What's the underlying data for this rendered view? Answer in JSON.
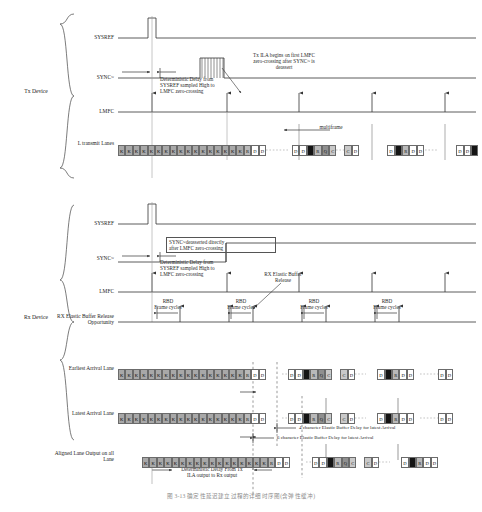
{
  "figure": {
    "caption": "图 3-13   确定性延迟建立过程的详细时序图(含弹性缓冲)",
    "width": 482,
    "height": 512
  },
  "devices": [
    {
      "id": "tx",
      "label": "Tx\nDevice"
    },
    {
      "id": "rx",
      "label": "Rx\nDevice"
    }
  ],
  "tx": {
    "signals": [
      {
        "name": "sysref",
        "label": "SYSREF"
      },
      {
        "name": "sync",
        "label": "SYNC~"
      },
      {
        "name": "lmfc",
        "label": "LMFC"
      },
      {
        "name": "lanes",
        "label": "L transmit\nLanes"
      }
    ],
    "annotations": [
      {
        "name": "tx-ila-note",
        "text": "Tx ILA begins on first LMFC\nzero-crossing after SYNC~ is\ndeassert"
      },
      {
        "name": "tx-det-delay-note",
        "text": "Deterministic Delay from\nSYSREF sampled High to\nLMFC zero-crossing"
      },
      {
        "name": "multiframe-label",
        "text": "multiframe"
      }
    ],
    "lane_groups": [
      {
        "name": "tx-k-run",
        "chars": [
          "K",
          "K",
          "K",
          "K",
          "K",
          "K",
          "K",
          "K",
          "K",
          "K",
          "K",
          "K",
          "K",
          "K",
          "K",
          "K",
          "K",
          "R",
          "D",
          "D"
        ]
      },
      {
        "name": "tx-seg-2",
        "chars": [
          "D",
          "D",
          "BK",
          "R",
          "Q",
          "C"
        ]
      },
      {
        "name": "tx-seg-3",
        "chars": [
          "C",
          "D"
        ]
      },
      {
        "name": "tx-seg-4",
        "chars": [
          "D",
          "BK",
          "R",
          "D",
          "D"
        ]
      },
      {
        "name": "tx-seg-5",
        "chars": [
          "D",
          "D",
          "BK"
        ]
      }
    ]
  },
  "rx": {
    "signals": [
      {
        "name": "sysref",
        "label": "SYSREF"
      },
      {
        "name": "sync",
        "label": "SYNC~"
      },
      {
        "name": "lmfc",
        "label": "LMFC"
      },
      {
        "name": "ebuf",
        "label": "RX Elastic Buffer\nRelease Opportunity"
      }
    ],
    "annotations": [
      {
        "name": "rx-sync-note",
        "text": "SYNC~deasserted directly\nafter LMFC zero-crossing"
      },
      {
        "name": "rx-det-delay-note",
        "text": "Deterministic Delay from\nSYSREF sampled High to\nLMFC zero-crossing"
      },
      {
        "name": "rx-release-note",
        "text": "RX Elastic Buffer\nRelease"
      }
    ],
    "rbd_labels": [
      {
        "name": "rbd-1",
        "text": "RBD\nFrame cycles"
      },
      {
        "name": "rbd-2",
        "text": "RBD\nFrame cycles"
      },
      {
        "name": "rbd-3",
        "text": "RBD\nFrame cycles"
      },
      {
        "name": "rbd-4",
        "text": "RBD\nFrame cycles"
      }
    ],
    "lanes": [
      {
        "name": "earliest-arrival-lane",
        "label": "Earliest Arrival\nLane"
      },
      {
        "name": "latest-arrival-lane",
        "label": "Latest Arrival\nLane"
      },
      {
        "name": "aligned-lane-output",
        "label": "Aligned Lane\nOutput on all\nLane"
      }
    ],
    "delay_notes": [
      {
        "name": "delay-4char",
        "text": "4 character Elastic Buffer Delay  for latest Arrival"
      },
      {
        "name": "delay-6char",
        "text": "6 character Elastic Buffer Delay  for latest Arrival"
      },
      {
        "name": "delay-tx-rx",
        "text": "Deterministic Delay From Tx\nILA output to Rx output"
      }
    ],
    "earliest_groups": [
      {
        "name": "e-k-run",
        "chars": [
          "K",
          "K",
          "K",
          "K",
          "K",
          "K",
          "K",
          "K",
          "K",
          "K",
          "K",
          "K",
          "K",
          "K",
          "K",
          "K",
          "K",
          "R",
          "D",
          "D"
        ]
      },
      {
        "name": "e-seg-2",
        "chars": [
          "D",
          "D",
          "BK",
          "R",
          "Q",
          "C"
        ]
      },
      {
        "name": "e-seg-3",
        "chars": [
          "C",
          "D"
        ]
      },
      {
        "name": "e-seg-4",
        "chars": [
          "D",
          "BK",
          "R",
          "D",
          "D"
        ]
      },
      {
        "name": "e-seg-5",
        "chars": [
          "D",
          "D"
        ]
      }
    ],
    "latest_groups": [
      {
        "name": "l-k-run",
        "chars": [
          "K",
          "K",
          "K",
          "K",
          "K",
          "K",
          "K",
          "K",
          "K",
          "K",
          "K",
          "K",
          "K",
          "K",
          "K",
          "K",
          "K",
          "R",
          "D",
          "D"
        ]
      },
      {
        "name": "l-seg-2",
        "chars": [
          "D",
          "D",
          "BK",
          "R",
          "Q",
          "C"
        ]
      },
      {
        "name": "l-seg-3",
        "chars": [
          "C",
          "D"
        ]
      },
      {
        "name": "l-seg-4",
        "chars": [
          "D",
          "BK",
          "R",
          "D",
          "D"
        ]
      },
      {
        "name": "l-seg-5",
        "chars": [
          "D",
          "D"
        ]
      }
    ],
    "aligned_groups": [
      {
        "name": "a-k-run",
        "chars": [
          "K",
          "K",
          "K",
          "K",
          "K",
          "K",
          "K",
          "K",
          "K",
          "K",
          "K",
          "K",
          "K",
          "K",
          "K",
          "K",
          "K",
          "R",
          "D",
          "D"
        ]
      },
      {
        "name": "a-seg-2",
        "chars": [
          "D",
          "D",
          "BK",
          "R",
          "Q",
          "C"
        ]
      },
      {
        "name": "a-seg-3",
        "chars": [
          "C",
          "D"
        ]
      },
      {
        "name": "a-seg-4",
        "chars": [
          "D",
          "BK",
          "R",
          "D",
          "D"
        ]
      }
    ]
  },
  "colors": {
    "line": "#333333",
    "k_char": "#a8a8a8",
    "d_char": "#ffffff",
    "r_char": "#b9b9b9",
    "q_char": "#8f8f8f",
    "c_char": "#c9c9c9",
    "black_char": "#141414"
  }
}
